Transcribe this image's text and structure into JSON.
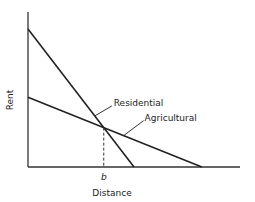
{
  "chart_data": {
    "type": "line",
    "title": "",
    "xlabel": "Distance",
    "ylabel": "Rent",
    "xlim": [
      0,
      1
    ],
    "ylim": [
      0,
      1
    ],
    "grid": false,
    "legend": "none",
    "series": [
      {
        "name": "Residential",
        "points": [
          [
            0,
            0.89
          ],
          [
            0.5,
            0
          ]
        ]
      },
      {
        "name": "Agricultural",
        "points": [
          [
            0,
            0.45
          ],
          [
            0.82,
            0
          ]
        ]
      }
    ],
    "annotations": [
      {
        "label": "Residential",
        "attached_to": "Residential"
      },
      {
        "label": "Agricultural",
        "attached_to": "Agricultural"
      },
      {
        "label": "b",
        "note": "distance at intersection (dashed drop line)",
        "x": 0.36
      }
    ]
  }
}
